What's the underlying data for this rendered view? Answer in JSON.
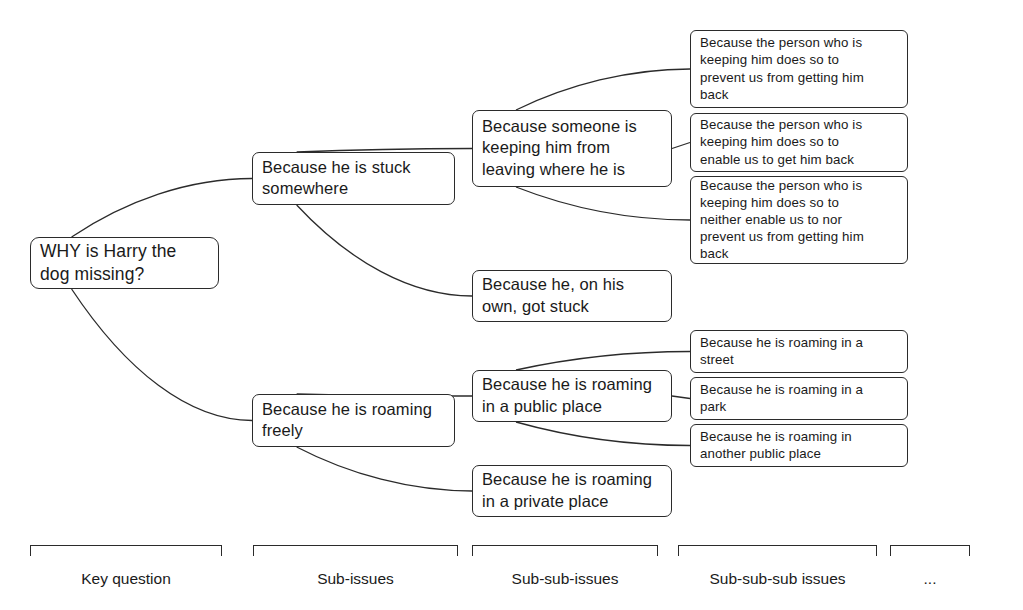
{
  "diagram": {
    "type": "issue-tree",
    "title_node": {
      "id": "key-question",
      "level": 0,
      "text": "WHY is Harry the\ndog missing?",
      "x": 30,
      "y": 237,
      "w": 189,
      "h": 52
    },
    "nodes": [
      {
        "id": "stuck-somewhere",
        "level": 1,
        "text": "Because he is stuck\nsomewhere",
        "x": 252,
        "y": 152,
        "w": 203,
        "h": 53
      },
      {
        "id": "roaming-freely",
        "level": 1,
        "text": "Because he is roaming\nfreely",
        "x": 252,
        "y": 394,
        "w": 203,
        "h": 53
      },
      {
        "id": "someone-keeping-him",
        "level": 2,
        "text": "Because someone is\nkeeping him from\nleaving where he is",
        "x": 472,
        "y": 110,
        "w": 200,
        "h": 77
      },
      {
        "id": "on-his-own-got-stuck",
        "level": 2,
        "text": "Because he, on his\nown, got stuck",
        "x": 472,
        "y": 270,
        "w": 200,
        "h": 52
      },
      {
        "id": "roaming-public-place",
        "level": 2,
        "text": "Because he is roaming\nin a public place",
        "x": 472,
        "y": 370,
        "w": 200,
        "h": 52
      },
      {
        "id": "roaming-private-place",
        "level": 2,
        "text": "Because he is roaming\nin a private place",
        "x": 472,
        "y": 465,
        "w": 200,
        "h": 52
      },
      {
        "id": "prevent-us-getting-him-back",
        "level": 3,
        "text": "Because the person who is\nkeeping him does so to\nprevent us from getting him\nback",
        "x": 690,
        "y": 30,
        "w": 218,
        "h": 78
      },
      {
        "id": "enable-us-get-him-back",
        "level": 3,
        "text": "Because the person who is\nkeeping him does so to\nenable us to get him back",
        "x": 690,
        "y": 113,
        "w": 218,
        "h": 59
      },
      {
        "id": "neither-enable-nor-prevent",
        "level": 3,
        "text": "Because the person who is\nkeeping him does so to\nneither enable us to nor\nprevent us from getting him\nback",
        "x": 690,
        "y": 176,
        "w": 218,
        "h": 88
      },
      {
        "id": "roaming-in-a-street",
        "level": 3,
        "text": "Because he is roaming in a\nstreet",
        "x": 690,
        "y": 330,
        "w": 218,
        "h": 43
      },
      {
        "id": "roaming-in-a-park",
        "level": 3,
        "text": "Because he is roaming in a\npark",
        "x": 690,
        "y": 377,
        "w": 218,
        "h": 43
      },
      {
        "id": "roaming-another-public-place",
        "level": 3,
        "text": "Because he is roaming in\nanother public place",
        "x": 690,
        "y": 424,
        "w": 218,
        "h": 43
      }
    ],
    "edges": [
      {
        "from": "key-question",
        "to": "stuck-somewhere"
      },
      {
        "from": "key-question",
        "to": "roaming-freely"
      },
      {
        "from": "stuck-somewhere",
        "to": "someone-keeping-him"
      },
      {
        "from": "stuck-somewhere",
        "to": "on-his-own-got-stuck"
      },
      {
        "from": "roaming-freely",
        "to": "roaming-public-place"
      },
      {
        "from": "roaming-freely",
        "to": "roaming-private-place"
      },
      {
        "from": "someone-keeping-him",
        "to": "prevent-us-getting-him-back"
      },
      {
        "from": "someone-keeping-him",
        "to": "enable-us-get-him-back"
      },
      {
        "from": "someone-keeping-him",
        "to": "neither-enable-nor-prevent"
      },
      {
        "from": "roaming-public-place",
        "to": "roaming-in-a-street"
      },
      {
        "from": "roaming-public-place",
        "to": "roaming-in-a-park"
      },
      {
        "from": "roaming-public-place",
        "to": "roaming-another-public-place"
      }
    ],
    "legend": {
      "columns": [
        {
          "id": "key-question",
          "label": "Key question",
          "x": 30,
          "w": 192
        },
        {
          "id": "sub-issues",
          "label": "Sub-issues",
          "x": 253,
          "w": 205
        },
        {
          "id": "sub-sub-issues",
          "label": "Sub-sub-issues",
          "x": 472,
          "w": 186
        },
        {
          "id": "sub-sub-sub-issues",
          "label": "Sub-sub-sub issues",
          "x": 678,
          "w": 199
        },
        {
          "id": "ellipsis",
          "label": "...",
          "x": 890,
          "w": 80
        }
      ],
      "bracket_y": 545,
      "label_y": 570
    },
    "colors": {
      "stroke": "#2b2b2b",
      "text": "#1a1a1a",
      "background": "#ffffff"
    }
  }
}
